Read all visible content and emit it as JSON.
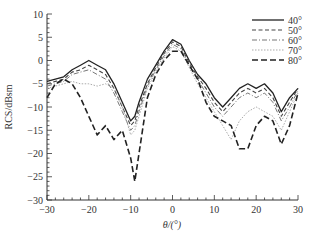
{
  "chart_data": {
    "type": "line",
    "title": "",
    "xlabel": "θ/(°)",
    "ylabel": "RCS/dBsm",
    "xlim": [
      -30,
      30
    ],
    "ylim": [
      -30,
      10
    ],
    "xticks": [
      -30,
      -20,
      -10,
      0,
      10,
      20,
      30
    ],
    "yticks": [
      10,
      5,
      0,
      -5,
      -10,
      -15,
      -20,
      -25,
      -30
    ],
    "grid": false,
    "legend_position": "upper right",
    "x": [
      -30,
      -28,
      -26,
      -24,
      -22,
      -20,
      -18,
      -16,
      -14,
      -12,
      -10,
      -9,
      -8,
      -6,
      -4,
      -2,
      0,
      2,
      4,
      6,
      8,
      10,
      12,
      14,
      16,
      18,
      20,
      22,
      24,
      26,
      28,
      30
    ],
    "series": [
      {
        "name": "40°",
        "style": "solid",
        "color": "#222222",
        "values": [
          -4.5,
          -4,
          -3.5,
          -2,
          -1,
          0,
          -1,
          -2,
          -5,
          -9,
          -13,
          -12,
          -9,
          -4,
          -1,
          2,
          4.5,
          3.5,
          0,
          -3,
          -5,
          -8,
          -10,
          -8,
          -6,
          -5,
          -6,
          -5,
          -7,
          -11,
          -8,
          -6
        ]
      },
      {
        "name": "50°",
        "style": "dashed",
        "color": "#444444",
        "values": [
          -5,
          -4.5,
          -4,
          -2.5,
          -2,
          -1,
          -2,
          -3,
          -6,
          -10,
          -14,
          -13,
          -10,
          -5,
          -1.5,
          1.5,
          4,
          3,
          -0.5,
          -3.5,
          -6,
          -9,
          -11,
          -9,
          -7,
          -6,
          -7,
          -6,
          -8,
          -12,
          -9,
          -6
        ]
      },
      {
        "name": "60°",
        "style": "dashdot",
        "color": "#777777",
        "values": [
          -5.5,
          -5,
          -4.5,
          -3,
          -2.5,
          -2,
          -3,
          -4,
          -7,
          -11,
          -15,
          -14,
          -11,
          -5.5,
          -2,
          1,
          3.5,
          2.5,
          -1,
          -4,
          -7,
          -10,
          -12,
          -10,
          -8,
          -7,
          -8,
          -7,
          -9,
          -13,
          -10,
          -6.5
        ]
      },
      {
        "name": "70°",
        "style": "dotted",
        "color": "#aaaaaa",
        "values": [
          -6,
          -5.5,
          -5,
          -4.5,
          -5,
          -5,
          -5.5,
          -5,
          -6,
          -10,
          -16,
          -15,
          -12,
          -6,
          -2.5,
          0.5,
          3,
          2,
          -1.5,
          -5,
          -8,
          -11,
          -14,
          -17,
          -13,
          -11,
          -10,
          -11,
          -12,
          -15,
          -11,
          -7
        ]
      },
      {
        "name": "80°",
        "style": "longdash",
        "color": "#222222",
        "values": [
          -8,
          -5,
          -4,
          -5,
          -8,
          -12,
          -16,
          -14,
          -17,
          -15,
          -21,
          -26,
          -20,
          -8,
          -3,
          0,
          2,
          2,
          -1,
          -4,
          -9,
          -12,
          -13,
          -14,
          -19,
          -19,
          -14,
          -12,
          -13,
          -18,
          -14,
          -7
        ]
      }
    ]
  }
}
